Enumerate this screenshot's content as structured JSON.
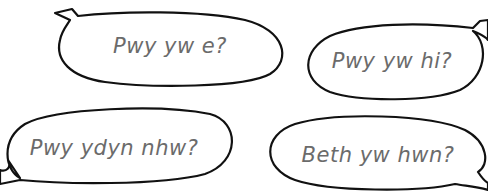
{
  "bubbles": [
    {
      "id": "bubble-1",
      "text": "Pwy yw e?",
      "tail": "top-left"
    },
    {
      "id": "bubble-2",
      "text": "Pwy yw hi?",
      "tail": "top-right"
    },
    {
      "id": "bubble-3",
      "text": "Pwy ydyn nhw?",
      "tail": "bottom-left"
    },
    {
      "id": "bubble-4",
      "text": "Beth yw hwn?",
      "tail": "bottom-right"
    }
  ],
  "colors": {
    "outline": "#111111",
    "text": "#6b6b6b",
    "background": "#ffffff"
  }
}
